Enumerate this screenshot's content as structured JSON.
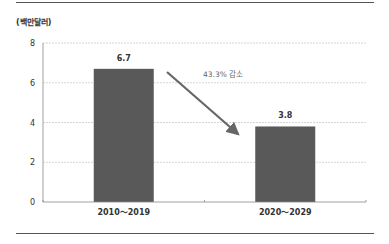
{
  "unit_label": "(백만달러)",
  "annotation": "43.3% 감소",
  "colors": {
    "bar": "#595959",
    "arrow": "#666666",
    "grid": "#cccccc",
    "axis": "#888888"
  },
  "chart_data": {
    "type": "bar",
    "title": "",
    "xlabel": "",
    "ylabel": "(백만달러)",
    "categories": [
      "2010～2019",
      "2020～2029"
    ],
    "values": [
      6.7,
      3.8
    ],
    "data_labels": [
      "6.7",
      "3.8"
    ],
    "ylim": [
      0,
      8
    ],
    "yticks": [
      0,
      2,
      4,
      6,
      8
    ],
    "grid": true,
    "legend": null,
    "annotations": [
      {
        "text": "43.3% 감소",
        "type": "arrow",
        "from": "2010～2019",
        "to": "2020～2029"
      }
    ]
  }
}
